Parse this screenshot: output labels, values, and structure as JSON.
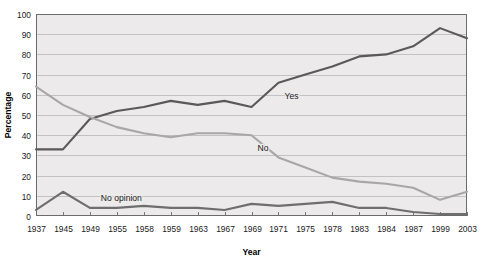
{
  "chart_data": {
    "type": "line",
    "title": "",
    "xlabel": "Year",
    "ylabel": "Percentage",
    "ylim": [
      0,
      100
    ],
    "ytick_step": 10,
    "grid": true,
    "legend_position": "inline-labels",
    "categories": [
      "1937",
      "1945",
      "1949",
      "1955",
      "1958",
      "1959",
      "1963",
      "1967",
      "1969",
      "1971",
      "1975",
      "1978",
      "1983",
      "1984",
      "1987",
      "1999",
      "2003"
    ],
    "yticks": [
      "0",
      "10",
      "20",
      "30",
      "40",
      "50",
      "60",
      "70",
      "80",
      "90",
      "100"
    ],
    "series": [
      {
        "name": "Yes",
        "color": "#595959",
        "label_x_index": 9,
        "values": [
          33,
          33,
          48,
          52,
          54,
          57,
          55,
          57,
          54,
          66,
          70,
          74,
          79,
          80,
          84,
          93,
          88
        ]
      },
      {
        "name": "No",
        "color": "#a8a6a6",
        "label_x_index": 8,
        "values": [
          64,
          55,
          49,
          44,
          41,
          39,
          41,
          41,
          40,
          29,
          24,
          19,
          17,
          16,
          14,
          8,
          12
        ]
      },
      {
        "name": "No opinion",
        "color": "#6e6e6e",
        "label_x_index": 3,
        "values": [
          3,
          12,
          4,
          4,
          5,
          4,
          4,
          3,
          6,
          5,
          6,
          7,
          4,
          4,
          2,
          1,
          1
        ]
      }
    ]
  },
  "plot": {
    "left": 36,
    "top": 14,
    "right": 467,
    "bottom": 216,
    "background": "#eceaea",
    "border_color": "#6b6b6b",
    "gridline_color": "#b9b7b7"
  },
  "axis_titles": {
    "y": "Percentage",
    "x": "Year"
  }
}
